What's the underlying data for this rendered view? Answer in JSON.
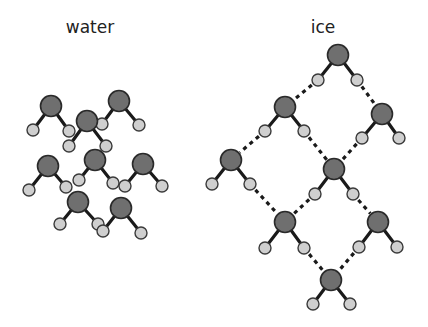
{
  "panels": {
    "water": {
      "title": "water",
      "title_pos": [
        90,
        33
      ]
    },
    "ice": {
      "title": "ice",
      "title_pos": [
        323,
        33
      ]
    }
  },
  "colors": {
    "oxygen": "#6f6f6f",
    "hydrogen": "#cfcfcf",
    "bond": "#1a1a1a",
    "background": "#ffffff"
  },
  "radii": {
    "oxygen": 10.5,
    "hydrogen": 6
  },
  "icons": {
    "oxygen_atom": "grey-circle",
    "hydrogen_atom": "light-grey-circle",
    "covalent_bond": "solid-line",
    "hydrogen_bond": "dashed-line"
  },
  "water_molecules": [
    {
      "o": [
        51,
        106
      ],
      "h": [
        [
          33,
          130
        ],
        [
          69,
          131
        ]
      ]
    },
    {
      "o": [
        119,
        101
      ],
      "h": [
        [
          102,
          124
        ],
        [
          139,
          125
        ]
      ]
    },
    {
      "o": [
        87,
        121
      ],
      "h": [
        [
          69,
          146
        ],
        [
          106,
          146
        ]
      ]
    },
    {
      "o": [
        95,
        160
      ],
      "h": [
        [
          79,
          180
        ],
        [
          113,
          183
        ]
      ]
    },
    {
      "o": [
        48,
        166
      ],
      "h": [
        [
          29,
          190
        ],
        [
          66,
          187
        ]
      ]
    },
    {
      "o": [
        143,
        164
      ],
      "h": [
        [
          125,
          186
        ],
        [
          162,
          186
        ]
      ]
    },
    {
      "o": [
        78,
        202
      ],
      "h": [
        [
          60,
          224
        ],
        [
          98,
          224
        ]
      ]
    },
    {
      "o": [
        121,
        208
      ],
      "h": [
        [
          103,
          231
        ],
        [
          141,
          233
        ]
      ]
    }
  ],
  "ice_molecules": [
    {
      "o": [
        338,
        55
      ],
      "h": [
        [
          318,
          80
        ],
        [
          357,
          80
        ]
      ]
    },
    {
      "o": [
        285,
        107
      ],
      "h": [
        [
          265,
          131
        ],
        [
          304,
          131
        ]
      ]
    },
    {
      "o": [
        382,
        114
      ],
      "h": [
        [
          362,
          138
        ],
        [
          399,
          138
        ]
      ]
    },
    {
      "o": [
        231,
        160
      ],
      "h": [
        [
          212,
          184
        ],
        [
          250,
          184
        ]
      ]
    },
    {
      "o": [
        334,
        169
      ],
      "h": [
        [
          315,
          194
        ],
        [
          353,
          194
        ]
      ]
    },
    {
      "o": [
        285,
        222
      ],
      "h": [
        [
          265,
          248
        ],
        [
          304,
          248
        ]
      ]
    },
    {
      "o": [
        378,
        222
      ],
      "h": [
        [
          359,
          247
        ],
        [
          397,
          247
        ]
      ]
    },
    {
      "o": [
        331,
        280
      ],
      "h": [
        [
          313,
          304
        ],
        [
          350,
          304
        ]
      ]
    }
  ],
  "ice_hydrogen_bonds": [
    {
      "from_mol": 0,
      "from_h": 0,
      "to_mol": 1
    },
    {
      "from_mol": 0,
      "from_h": 1,
      "to_mol": 2
    },
    {
      "from_mol": 1,
      "from_h": 0,
      "to_mol": 3
    },
    {
      "from_mol": 1,
      "from_h": 1,
      "to_mol": 4
    },
    {
      "from_mol": 2,
      "from_h": 0,
      "to_mol": 4
    },
    {
      "from_mol": 3,
      "from_h": 1,
      "to_mol": 5
    },
    {
      "from_mol": 4,
      "from_h": 0,
      "to_mol": 5
    },
    {
      "from_mol": 4,
      "from_h": 1,
      "to_mol": 6
    },
    {
      "from_mol": 5,
      "from_h": 1,
      "to_mol": 7
    },
    {
      "from_mol": 6,
      "from_h": 0,
      "to_mol": 7
    }
  ]
}
